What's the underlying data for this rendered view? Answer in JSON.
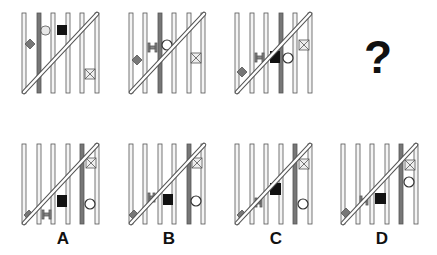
{
  "puzzle": {
    "question_mark": "?",
    "description": "Six vertical bars with a diagonal rod; small shapes slide along bars",
    "colors": {
      "bar_light": "#f4f4f4",
      "bar_dark": "#777777",
      "stroke": "#555555",
      "black": "#111111",
      "shape_gray": "#777777"
    }
  },
  "sequence": [
    {
      "id": "panel-1",
      "dark_bar": 1,
      "shapes": [
        "diamond bar0",
        "capsule bar1",
        "black-square bar2",
        "x-box bar4 low"
      ]
    },
    {
      "id": "panel-2",
      "dark_bar": 2,
      "shapes": [
        "diamond bar0",
        "i-beam bar1-2",
        "circle bar2",
        "x-box bar4"
      ]
    },
    {
      "id": "panel-3",
      "dark_bar": 3,
      "shapes": [
        "diamond bar0",
        "i-beam bar1-2",
        "black-square bar3",
        "circle bar3-4",
        "x-box bar4 high"
      ]
    },
    {
      "id": "panel-4",
      "unknown": true
    }
  ],
  "options": [
    {
      "label": "A"
    },
    {
      "label": "B"
    },
    {
      "label": "C"
    },
    {
      "label": "D"
    }
  ]
}
